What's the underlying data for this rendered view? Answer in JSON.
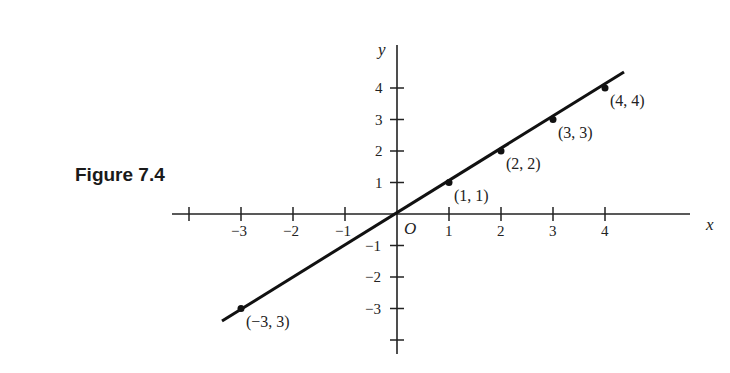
{
  "figure": {
    "caption": "Figure 7.4",
    "x_axis_label": "x",
    "y_axis_label": "y",
    "origin_label": "O"
  },
  "chart_data": {
    "type": "line",
    "title": "Figure 7.4",
    "xlabel": "x",
    "ylabel": "y",
    "x_ticks": [
      -3,
      -2,
      -1,
      1,
      2,
      3,
      4
    ],
    "y_ticks": [
      -3,
      -2,
      -1,
      1,
      2,
      3,
      4
    ],
    "xlim": [
      -4,
      5.5
    ],
    "ylim": [
      -4,
      5.5
    ],
    "grid": false,
    "legend": null,
    "series": [
      {
        "name": "y = x",
        "points": [
          {
            "x": -3,
            "y": -3,
            "label": "(−3, 3)"
          },
          {
            "x": 1,
            "y": 1,
            "label": "(1, 1)"
          },
          {
            "x": 2,
            "y": 2,
            "label": "(2, 2)"
          },
          {
            "x": 3,
            "y": 3,
            "label": "(3, 3)"
          },
          {
            "x": 4,
            "y": 4,
            "label": "(4, 4)"
          }
        ]
      }
    ],
    "annotations": [
      "O"
    ]
  }
}
